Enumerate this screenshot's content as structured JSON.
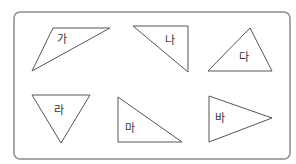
{
  "frame": {
    "x": 14,
    "y": 12,
    "width": 276,
    "height": 147,
    "radius": 6,
    "stroke": "#8c8c8c"
  },
  "triangles": [
    {
      "label": "가",
      "points": "53,28 110,28 32,71",
      "label_pos": [
        57,
        43
      ]
    },
    {
      "label": "나",
      "points": "133,26 188,26 188,72",
      "label_pos": [
        165,
        44
      ]
    },
    {
      "label": "다",
      "points": "250,28 208,71 272,71",
      "label_pos": [
        239,
        61
      ]
    },
    {
      "label": "라",
      "points": "32,95 90,95 61,143",
      "label_pos": [
        54,
        114
      ]
    },
    {
      "label": "마",
      "points": "118,97 118,142 182,142",
      "label_pos": [
        125,
        132
      ]
    },
    {
      "label": "바",
      "points": "209,96 209,142 272,118",
      "label_pos": [
        215,
        122
      ]
    }
  ]
}
